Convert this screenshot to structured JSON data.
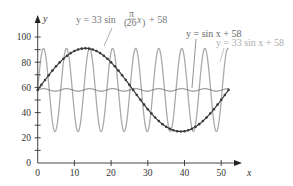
{
  "chart_data": {
    "type": "line",
    "title": "",
    "xlabel": "x",
    "ylabel": "y",
    "xlim": [
      0,
      55
    ],
    "ylim": [
      0,
      110
    ],
    "x_ticks": [
      0,
      10,
      20,
      30,
      40,
      50
    ],
    "y_ticks": [
      0,
      20,
      40,
      60,
      80,
      100
    ],
    "y_minor_ticks": [
      10,
      30,
      50,
      70,
      90
    ],
    "grid": false,
    "legend": "inline-annotations",
    "series": [
      {
        "name": "y = 33 sin x + 58",
        "formula": "33*sin(x)+58",
        "x_range": [
          0,
          52
        ],
        "color": "#aaaaaa",
        "style": "solid"
      },
      {
        "name": "y = sin x + 58",
        "formula": "sin(x)+58",
        "x_range": [
          0,
          52
        ],
        "color": "#666666",
        "style": "solid"
      },
      {
        "name": "y = 33 sin(π/26 x) + 58",
        "formula": "33*sin(pi/26*x)+58",
        "x_range": [
          0,
          52
        ],
        "color": "#3a3a3a",
        "style": "line-with-dots"
      }
    ],
    "annotations": [
      {
        "text_main": "y = 33 sin",
        "frac_num": "π",
        "frac_den": "26",
        "text_tail": "x",
        "text_end": "+ 58"
      },
      {
        "text": "y = sin x + 58"
      },
      {
        "text": "y = 33 sin x + 58"
      }
    ]
  },
  "labels": {
    "x_axis": "x",
    "y_axis": "y",
    "x_ticks": [
      "0",
      "10",
      "20",
      "30",
      "40",
      "50"
    ],
    "y_ticks": [
      "0",
      "20",
      "40",
      "60",
      "80",
      "100"
    ],
    "curve1_prefix": "y = 33 sin",
    "curve1_num": "π",
    "curve1_den": "26",
    "curve1_var": "x",
    "curve1_suffix": "+ 58",
    "curve2": "y = sin x + 58",
    "curve3": "y = 33 sin x + 58"
  }
}
